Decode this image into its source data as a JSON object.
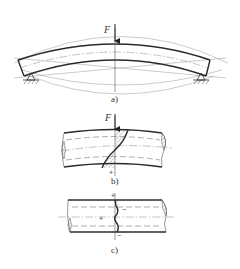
{
  "figure": {
    "panels": [
      {
        "id": "a",
        "label": "a)",
        "force_label": "F",
        "description": "Simply supported beam bending under central point load F"
      },
      {
        "id": "b",
        "label": "b)",
        "force_label": "F",
        "sign_bottom": "+",
        "description": "Beam segment with hatched stress distribution across section"
      },
      {
        "id": "c",
        "label": "c)",
        "sign_top": "+",
        "sign_middle": "+",
        "sign_right": "−",
        "sign_bottom": "−",
        "description": "Beam segment with wavy residual stress distribution"
      }
    ],
    "colors": {
      "line": "#2a2a2a",
      "background": "#ffffff"
    }
  }
}
